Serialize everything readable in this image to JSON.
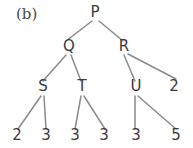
{
  "figure": {
    "panel_label": "(b)",
    "background_color": "#ffffff",
    "edge_color": "#8a8a8a",
    "text_color": "#3a3a3a"
  },
  "chart_data": {
    "type": "diagram",
    "diagram_type": "tree",
    "title": "(b)",
    "nodes": [
      {
        "id": "P",
        "label": "P",
        "depth": 0,
        "x": 95,
        "y": 17,
        "kind": "internal"
      },
      {
        "id": "Q",
        "label": "Q",
        "depth": 1,
        "x": 69,
        "y": 51,
        "kind": "internal"
      },
      {
        "id": "R",
        "label": "R",
        "depth": 1,
        "x": 124,
        "y": 51,
        "kind": "internal"
      },
      {
        "id": "S",
        "label": "S",
        "depth": 2,
        "x": 43,
        "y": 91,
        "kind": "internal"
      },
      {
        "id": "T",
        "label": "T",
        "depth": 2,
        "x": 82,
        "y": 91,
        "kind": "internal"
      },
      {
        "id": "U",
        "label": "U",
        "depth": 2,
        "x": 136,
        "y": 91,
        "kind": "internal"
      },
      {
        "id": "L0",
        "label": "2",
        "depth": 2,
        "x": 174,
        "y": 91,
        "kind": "leaf",
        "value": 2
      },
      {
        "id": "L1",
        "label": "2",
        "depth": 3,
        "x": 17,
        "y": 140,
        "kind": "leaf",
        "value": 2
      },
      {
        "id": "L2",
        "label": "3",
        "depth": 3,
        "x": 46,
        "y": 140,
        "kind": "leaf",
        "value": 3
      },
      {
        "id": "L3",
        "label": "3",
        "depth": 3,
        "x": 75,
        "y": 140,
        "kind": "leaf",
        "value": 3
      },
      {
        "id": "L4",
        "label": "3",
        "depth": 3,
        "x": 104,
        "y": 140,
        "kind": "leaf",
        "value": 3
      },
      {
        "id": "L5",
        "label": "3",
        "depth": 3,
        "x": 136,
        "y": 140,
        "kind": "leaf",
        "value": 3
      },
      {
        "id": "L6",
        "label": "5",
        "depth": 3,
        "x": 176,
        "y": 140,
        "kind": "leaf",
        "value": 5
      }
    ],
    "edges": [
      {
        "from": "P",
        "to": "Q",
        "x1": 92,
        "y1": 21,
        "x2": 66,
        "y2": 41
      },
      {
        "from": "P",
        "to": "R",
        "x1": 99,
        "y1": 21,
        "x2": 123,
        "y2": 41
      },
      {
        "from": "Q",
        "to": "S",
        "x1": 66,
        "y1": 55,
        "x2": 43,
        "y2": 81
      },
      {
        "from": "Q",
        "to": "T",
        "x1": 71,
        "y1": 55,
        "x2": 81,
        "y2": 81
      },
      {
        "from": "R",
        "to": "U",
        "x1": 124,
        "y1": 55,
        "x2": 135,
        "y2": 81
      },
      {
        "from": "R",
        "to": "L0",
        "x1": 128,
        "y1": 54,
        "x2": 176,
        "y2": 79
      },
      {
        "from": "S",
        "to": "L1",
        "x1": 41,
        "y1": 96,
        "x2": 18,
        "y2": 129
      },
      {
        "from": "S",
        "to": "L2",
        "x1": 44,
        "y1": 96,
        "x2": 46,
        "y2": 129
      },
      {
        "from": "T",
        "to": "L3",
        "x1": 81,
        "y1": 96,
        "x2": 75,
        "y2": 129
      },
      {
        "from": "T",
        "to": "L4",
        "x1": 84,
        "y1": 96,
        "x2": 105,
        "y2": 129
      },
      {
        "from": "U",
        "to": "L5",
        "x1": 135,
        "y1": 96,
        "x2": 135,
        "y2": 129
      },
      {
        "from": "U",
        "to": "L6",
        "x1": 138,
        "y1": 96,
        "x2": 176,
        "y2": 129
      }
    ],
    "leaf_values": [
      2,
      3,
      3,
      3,
      3,
      5
    ],
    "panel_label_position": {
      "x": 16,
      "y": 19
    }
  }
}
